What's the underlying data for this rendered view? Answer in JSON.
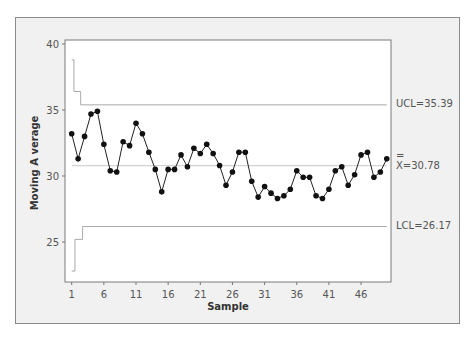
{
  "chart_data": {
    "type": "line",
    "title": "",
    "xlabel": "Sample",
    "ylabel": "Moving A verage",
    "ylim": [
      22,
      40
    ],
    "xlim": [
      1,
      50
    ],
    "y_ticks": [
      25,
      30,
      35,
      40
    ],
    "x_ticks": [
      1,
      6,
      11,
      16,
      21,
      26,
      31,
      36,
      41,
      46
    ],
    "grid": false,
    "legend": null,
    "x": [
      1,
      2,
      3,
      4,
      5,
      6,
      7,
      8,
      9,
      10,
      11,
      12,
      13,
      14,
      15,
      16,
      17,
      18,
      19,
      20,
      21,
      22,
      23,
      24,
      25,
      26,
      27,
      28,
      29,
      30,
      31,
      32,
      33,
      34,
      35,
      36,
      37,
      38,
      39,
      40,
      41,
      42,
      43,
      44,
      45,
      46,
      47,
      48,
      49,
      50
    ],
    "series": [
      {
        "name": "Moving Average",
        "values": [
          33.2,
          31.3,
          33.0,
          34.7,
          34.9,
          32.4,
          30.4,
          30.3,
          32.6,
          32.3,
          34.0,
          33.2,
          31.8,
          30.5,
          28.8,
          30.5,
          30.5,
          31.6,
          30.7,
          32.1,
          31.7,
          32.4,
          31.7,
          30.8,
          29.3,
          30.3,
          31.8,
          31.8,
          29.6,
          28.4,
          29.2,
          28.7,
          28.3,
          28.5,
          29.0,
          30.4,
          29.9,
          29.9,
          28.5,
          28.3,
          29.0,
          30.4,
          30.7,
          29.3,
          30.1,
          31.6,
          31.8,
          29.9,
          30.3,
          31.3
        ]
      }
    ],
    "control_limits": {
      "ucl": {
        "label": "UCL=35.39",
        "value": 35.39,
        "steps": [
          {
            "x_from": 1,
            "x_to": 1.35,
            "value": 38.8
          },
          {
            "x_from": 1.35,
            "x_to": 2.4,
            "value": 36.4
          }
        ]
      },
      "center": {
        "label_bar": "=",
        "label_rest": "X=30.78",
        "value": 30.78
      },
      "lcl": {
        "label": "LCL=26.17",
        "value": 26.17,
        "steps": [
          {
            "x_from": 1,
            "x_to": 1.5,
            "value": 22.8
          },
          {
            "x_from": 1.5,
            "x_to": 2.7,
            "value": 25.2
          }
        ]
      }
    }
  }
}
